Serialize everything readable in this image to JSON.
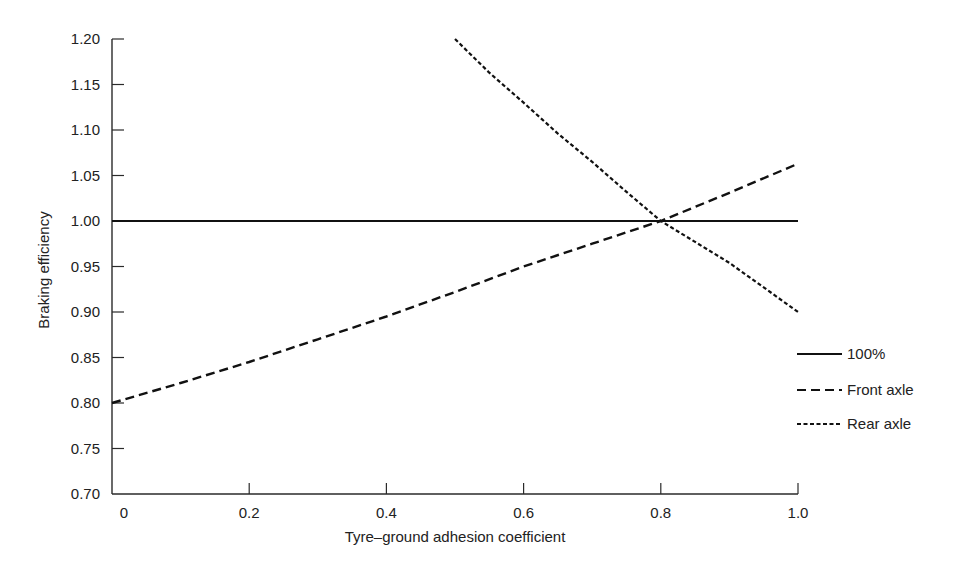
{
  "chart_data": {
    "type": "line",
    "title": "",
    "xlabel": "Tyre–ground adhesion coefficient",
    "ylabel": "Braking efficiency",
    "xlim": [
      0,
      1.0
    ],
    "ylim": [
      0.7,
      1.2
    ],
    "x_ticks": [
      "0",
      "0.2",
      "0.4",
      "0.6",
      "0.8",
      "1.0"
    ],
    "x_tick_values": [
      0,
      0.2,
      0.4,
      0.6,
      0.8,
      1.0
    ],
    "y_ticks": [
      "0.70",
      "0.75",
      "0.80",
      "0.85",
      "0.90",
      "0.95",
      "1.00",
      "1.05",
      "1.10",
      "1.15",
      "1.20"
    ],
    "y_tick_values": [
      0.7,
      0.75,
      0.8,
      0.85,
      0.9,
      0.95,
      1.0,
      1.05,
      1.1,
      1.15,
      1.2
    ],
    "grid": false,
    "legend_position": "right",
    "series": [
      {
        "name": "100%",
        "style": "solid",
        "x": [
          0,
          1.0
        ],
        "values": [
          1.0,
          1.0
        ]
      },
      {
        "name": "Front axle",
        "style": "dashed",
        "x": [
          0,
          0.1,
          0.2,
          0.3,
          0.4,
          0.5,
          0.6,
          0.7,
          0.8,
          0.9,
          1.0
        ],
        "values": [
          0.8,
          0.822,
          0.845,
          0.87,
          0.895,
          0.922,
          0.95,
          0.975,
          1.0,
          1.031,
          1.063
        ]
      },
      {
        "name": "Rear axle",
        "style": "dotted",
        "x": [
          0.5,
          0.55,
          0.6,
          0.65,
          0.7,
          0.75,
          0.8,
          0.85,
          0.9,
          0.95,
          1.0
        ],
        "values": [
          1.2,
          1.163,
          1.13,
          1.096,
          1.065,
          1.032,
          1.0,
          0.977,
          0.954,
          0.927,
          0.9
        ]
      }
    ]
  },
  "legend": {
    "items": [
      {
        "label": "100%",
        "style": "solid"
      },
      {
        "label": "Front axle",
        "style": "dashed"
      },
      {
        "label": "Rear axle",
        "style": "dotted"
      }
    ]
  },
  "colors": {
    "line": "#111111",
    "axis": "#2a2a2a",
    "background": "#ffffff"
  }
}
